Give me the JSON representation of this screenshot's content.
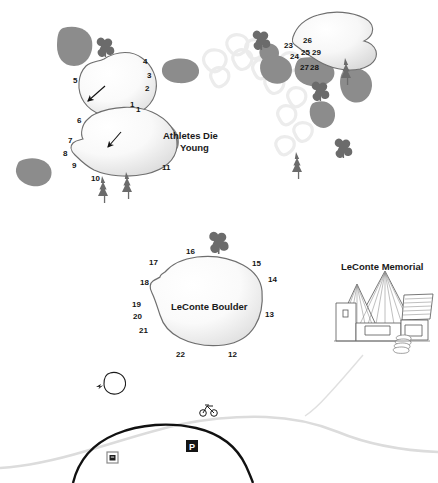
{
  "map": {
    "title": "LeConte Boulder area bouldering topo map",
    "areas": [
      {
        "name": "Athletes Die Young",
        "label": "Athletes Die\nYoung",
        "line1": "Athletes Die",
        "line2": "Young"
      },
      {
        "name": "LeConte Boulder",
        "label": "LeConte Boulder"
      },
      {
        "name": "LeConte Memorial",
        "label": "LeConte Memorial"
      }
    ],
    "problem_numbers_upper_left": [
      "1",
      "2",
      "3",
      "4",
      "5",
      "6",
      "7",
      "8",
      "9",
      "10",
      "11"
    ],
    "problem_numbers_upper_right": [
      "23",
      "24",
      "25",
      "26",
      "27",
      "28",
      "29"
    ],
    "problem_numbers_leconte": [
      "12",
      "13",
      "14",
      "15",
      "16",
      "17",
      "18",
      "19",
      "20",
      "21",
      "22"
    ],
    "numbers": {
      "n1a": "1",
      "n2": "2",
      "n3": "3",
      "n4": "4",
      "n5": "5",
      "n1b": "1",
      "n6": "6",
      "n7": "7",
      "n8": "8",
      "n9": "9",
      "n10": "10",
      "n11": "11",
      "n23": "23",
      "n24": "24",
      "n25": "25",
      "n26": "26",
      "n27": "27",
      "n28": "28",
      "n29": "29",
      "n12": "12",
      "n13": "13",
      "n14": "14",
      "n15": "15",
      "n16": "16",
      "n17": "17",
      "n18": "18",
      "n19": "19",
      "n20": "20",
      "n21": "21",
      "n22": "22"
    },
    "icons": {
      "parking": "P",
      "bicycle": "bicycle-icon",
      "restroom": "restroom-icon",
      "tree_deciduous": "deciduous-tree-icon",
      "tree_conifer": "conifer-tree-icon",
      "approach_arrow": "approach-arrow-icon"
    },
    "colors": {
      "boulder_outline": "#6e6e6e",
      "boulder_fill_light": "#fbfbfb",
      "boulder_fill_shadow": "#d9d9d9",
      "rock_gray": "#8c8c8c",
      "rock_gray_light": "#efefef",
      "tree_gray": "#6b6b6b",
      "road_black": "#111111",
      "trail_gray": "#d4d4d4",
      "text_black": "#141414",
      "background": "#ffffff"
    }
  }
}
